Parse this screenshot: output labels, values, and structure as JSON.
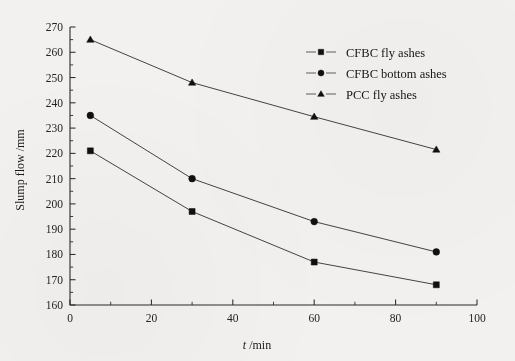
{
  "chart_data": {
    "type": "line",
    "title": "",
    "xlabel": "t /min",
    "xlabel_italic": "t",
    "xlabel_rest": " /min",
    "ylabel": "Slump flow /mm",
    "xlim": [
      0,
      100
    ],
    "ylim": [
      160,
      270
    ],
    "x_major_ticks": [
      0,
      20,
      40,
      60,
      80,
      100
    ],
    "x_minor_step": 10,
    "y_major_ticks": [
      160,
      170,
      180,
      190,
      200,
      210,
      220,
      230,
      240,
      250,
      260,
      270
    ],
    "y_minor_step": 5,
    "grid": false,
    "legend_position": "top-right",
    "x": [
      5,
      30,
      60,
      90
    ],
    "series": [
      {
        "name": "CFBC fly ashes",
        "marker": "square",
        "values": [
          221,
          197,
          177,
          168
        ]
      },
      {
        "name": "CFBC bottom ashes",
        "marker": "circle",
        "values": [
          235,
          210,
          193,
          181
        ]
      },
      {
        "name": "PCC fly ashes",
        "marker": "triangle",
        "values": [
          265,
          248,
          234.5,
          221.5
        ]
      }
    ],
    "colors": {
      "line": "#3a3a3a",
      "marker": "#101010",
      "axis": "#2b2b2b",
      "background": "#f2f1ef"
    }
  },
  "axis": {
    "x_tick_labels": [
      "0",
      "20",
      "40",
      "60",
      "80",
      "100"
    ],
    "y_tick_labels": [
      "160",
      "170",
      "180",
      "190",
      "200",
      "210",
      "220",
      "230",
      "240",
      "250",
      "260",
      "270"
    ]
  },
  "legend": {
    "entries": [
      {
        "label": "CFBC fly ashes",
        "marker": "square-marker-icon"
      },
      {
        "label": "CFBC bottom ashes",
        "marker": "circle-marker-icon"
      },
      {
        "label": "PCC fly ashes",
        "marker": "triangle-marker-icon"
      }
    ]
  }
}
